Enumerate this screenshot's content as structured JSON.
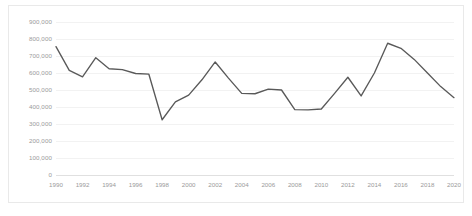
{
  "chart_data": {
    "type": "line",
    "title": "",
    "subtitle": "",
    "xlabel": "",
    "ylabel": "",
    "legend": [],
    "legend_position": "none",
    "grid": true,
    "grid_axis": "y",
    "line_color": "#595959",
    "background_color": "#ffffff",
    "gridline_color": "#f2f2f2",
    "tick_label_color": "#9a9a9a",
    "xlim": [
      1990,
      2020
    ],
    "ylim": [
      0,
      900000
    ],
    "ytick_values": [
      0,
      100000,
      200000,
      300000,
      400000,
      500000,
      600000,
      700000,
      800000,
      900000
    ],
    "ytick_labels": [
      "0",
      "100,000",
      "200,000",
      "300,000",
      "400,000",
      "500,000",
      "600,000",
      "700,000",
      "800,000",
      "900,000"
    ],
    "xtick_values": [
      1990,
      1992,
      1994,
      1996,
      1998,
      2000,
      2002,
      2004,
      2006,
      2008,
      2010,
      2012,
      2014,
      2016,
      2018,
      2020
    ],
    "xtick_labels": [
      "1990",
      "1992",
      "1994",
      "1996",
      "1998",
      "2000",
      "2002",
      "2004",
      "2006",
      "2008",
      "2010",
      "2012",
      "2014",
      "2016",
      "2018",
      "2020"
    ],
    "x": [
      1990,
      1991,
      1992,
      1993,
      1994,
      1995,
      1996,
      1997,
      1998,
      1999,
      2000,
      2001,
      2002,
      2003,
      2004,
      2005,
      2006,
      2007,
      2008,
      2009,
      2010,
      2011,
      2012,
      2013,
      2014,
      2015,
      2016,
      2017,
      2018,
      2019,
      2020
    ],
    "values": [
      755000,
      615000,
      577000,
      690000,
      625000,
      620000,
      597000,
      593000,
      325000,
      430000,
      470000,
      560000,
      665000,
      570000,
      480000,
      478000,
      505000,
      500000,
      385000,
      383000,
      388000,
      480000,
      575000,
      465000,
      600000,
      775000,
      745000,
      680000,
      600000,
      520000,
      455000
    ]
  }
}
